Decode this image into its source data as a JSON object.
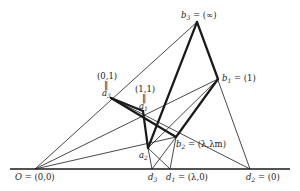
{
  "diagram": {
    "type": "projective-configuration",
    "points": {
      "O": {
        "x": 35,
        "y": 169,
        "label": "O = (0,0)"
      },
      "b3": {
        "x": 197,
        "y": 22,
        "label": "b3 = (∞)"
      },
      "b1": {
        "x": 218,
        "y": 79,
        "label": "b1 = (1)"
      },
      "a3": {
        "x": 111,
        "y": 98,
        "label_top": "(0,1)",
        "label_eq": "‖",
        "label_name": "a3"
      },
      "a1": {
        "x": 143,
        "y": 111,
        "label_top": "(1,1)",
        "label_eq": "‖",
        "label_name": "a1"
      },
      "a2": {
        "x": 148,
        "y": 148,
        "label": "a2"
      },
      "b2": {
        "x": 176,
        "y": 137,
        "label": "b2 = (λ,λm)"
      },
      "d3": {
        "x": 152,
        "y": 169,
        "label": "d3"
      },
      "d1": {
        "x": 170,
        "y": 169,
        "label": "d1 = (λ,0)"
      },
      "d2": {
        "x": 250,
        "y": 169,
        "label": "d2 = (0)"
      }
    },
    "labels": {
      "origin": "O = (0,0)",
      "b3": "b",
      "b3_sub": "3",
      "b3_val": " = (∞)",
      "b1": "b",
      "b1_sub": "1",
      "b1_val": " = (1)",
      "a3_coord": "(0,1)",
      "a3_eq": "‖",
      "a3": "a",
      "a3_sub": "3",
      "a1_coord": "(1,1)",
      "a1_eq": "‖",
      "a1": "a",
      "a1_sub": "1",
      "a2": "a",
      "a2_sub": "2",
      "b2": "b",
      "b2_sub": "2",
      "b2_val": " = (λ,λm)",
      "d3": "d",
      "d3_sub": "3",
      "d1": "d",
      "d1_sub": "1",
      "d1_val": " = (λ,0)",
      "d2": "d",
      "d2_sub": "2",
      "d2_val": " = (0)",
      "O": "O",
      "O_val": " = (0,0)"
    },
    "thin_lines": [
      [
        "O",
        "b3"
      ],
      [
        "O",
        "b1"
      ],
      [
        "O",
        "b2"
      ],
      [
        "b1",
        "a2"
      ],
      [
        "a3",
        "d2"
      ],
      [
        "b3",
        "d2"
      ],
      [
        "d3",
        "a2"
      ],
      [
        "d3",
        "b2"
      ],
      [
        "d1",
        "a2"
      ],
      [
        "d1",
        "b2"
      ]
    ],
    "thick_lines": [
      [
        "b3",
        "a2"
      ],
      [
        "b3",
        "b1"
      ],
      [
        "b1",
        "b2"
      ],
      [
        "a3",
        "a1"
      ],
      [
        "a3",
        "b2"
      ],
      [
        "a1",
        "a2"
      ]
    ],
    "baseline": {
      "x1": 10,
      "x2": 290,
      "y": 169
    }
  }
}
